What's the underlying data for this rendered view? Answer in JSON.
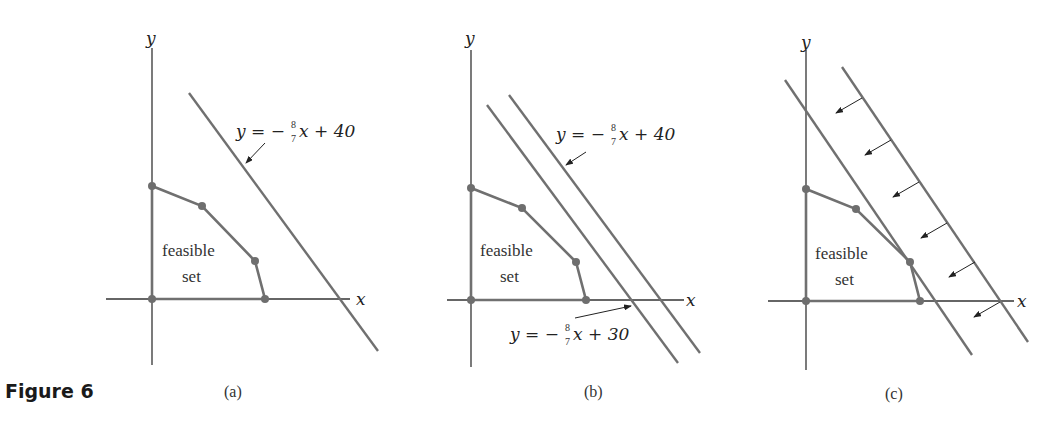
{
  "figure": {
    "label": "Figure 6"
  },
  "colors": {
    "axis": "#333333",
    "line": "#707070",
    "vertex": "#6e6e6e",
    "text": "#222222"
  },
  "panels": [
    {
      "id": "a",
      "caption": "(a)",
      "axis_x": "x",
      "axis_y": "y",
      "region_label": [
        "feasible",
        "set"
      ],
      "lines": [
        {
          "equation": "y = −(8/7)x + 40",
          "lhs": "y = −",
          "num": "8",
          "den": "7",
          "rhs": "x + 40"
        }
      ]
    },
    {
      "id": "b",
      "caption": "(b)",
      "axis_x": "x",
      "axis_y": "y",
      "region_label": [
        "feasible",
        "set"
      ],
      "lines": [
        {
          "equation": "y = −(8/7)x + 40",
          "lhs": "y = −",
          "num": "8",
          "den": "7",
          "rhs": "x + 40"
        },
        {
          "equation": "y = −(8/7)x + 30",
          "lhs": "y = −",
          "num": "8",
          "den": "7",
          "rhs": "x + 30"
        }
      ]
    },
    {
      "id": "c",
      "caption": "(c)",
      "axis_x": "x",
      "axis_y": "y",
      "region_label": [
        "feasible",
        "set"
      ],
      "lines": [],
      "arrows_count": 6
    }
  ]
}
